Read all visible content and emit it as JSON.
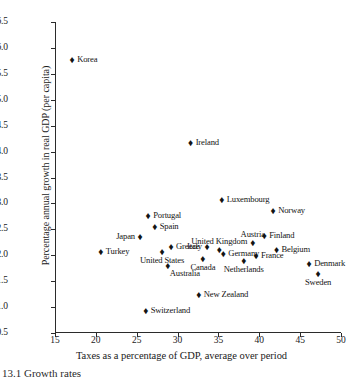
{
  "chart_data": {
    "type": "scatter",
    "title": "",
    "xlabel": "Taxes as a percentage of GDP, average over period",
    "ylabel": "Percentage annual growth in real GDP (per capita)",
    "xlim": [
      15,
      50
    ],
    "ylim": [
      0.5,
      6.5
    ],
    "xticks": [
      "15",
      "20",
      "25",
      "30",
      "35",
      "40",
      "45",
      "50"
    ],
    "yticks": [
      "0.5",
      "1.0",
      "1.5",
      "2.0",
      "2.5",
      "3.0",
      "3.5",
      "4.0",
      "4.5",
      "5.0",
      "5.5",
      "6.0",
      "6.5"
    ],
    "grid": false,
    "legend": false,
    "marker": "diamond",
    "marker_color": "#141414",
    "points": [
      {
        "label": "Korea",
        "x": 17.1,
        "y": 5.76,
        "label_pos": "right"
      },
      {
        "label": "Ireland",
        "x": 31.6,
        "y": 4.17,
        "label_pos": "right"
      },
      {
        "label": "Luxembourg",
        "x": 35.4,
        "y": 3.07,
        "label_pos": "right"
      },
      {
        "label": "Norway",
        "x": 41.7,
        "y": 2.86,
        "label_pos": "right"
      },
      {
        "label": "Portugal",
        "x": 26.4,
        "y": 2.75,
        "label_pos": "right"
      },
      {
        "label": "Spain",
        "x": 27.2,
        "y": 2.54,
        "label_pos": "right"
      },
      {
        "label": "Finland",
        "x": 40.6,
        "y": 2.38,
        "label_pos": "right"
      },
      {
        "label": "Japan",
        "x": 25.4,
        "y": 2.35,
        "label_pos": "left"
      },
      {
        "label": "Austria",
        "x": 39.2,
        "y": 2.23,
        "label_pos": "above"
      },
      {
        "label": "Greece",
        "x": 29.2,
        "y": 2.15,
        "label_pos": "right"
      },
      {
        "label": "Italy",
        "x": 33.6,
        "y": 2.15,
        "label_pos": "left"
      },
      {
        "label": "United Kingdom",
        "x": 35.1,
        "y": 2.1,
        "label_pos": "above"
      },
      {
        "label": "Belgium",
        "x": 42.1,
        "y": 2.1,
        "label_pos": "right"
      },
      {
        "label": "Turkey",
        "x": 20.6,
        "y": 2.06,
        "label_pos": "right"
      },
      {
        "label": "United States",
        "x": 28.1,
        "y": 2.06,
        "label_pos": "below"
      },
      {
        "label": "Germany",
        "x": 35.6,
        "y": 2.02,
        "label_pos": "right"
      },
      {
        "label": "France",
        "x": 39.6,
        "y": 1.98,
        "label_pos": "right"
      },
      {
        "label": "Canada",
        "x": 33.1,
        "y": 1.92,
        "label_pos": "below"
      },
      {
        "label": "Netherlands",
        "x": 38.1,
        "y": 1.88,
        "label_pos": "below"
      },
      {
        "label": "Australia",
        "x": 28.8,
        "y": 1.8,
        "label_pos": "below-right"
      },
      {
        "label": "Denmark",
        "x": 46.1,
        "y": 1.84,
        "label_pos": "right"
      },
      {
        "label": "Sweden",
        "x": 47.2,
        "y": 1.63,
        "label_pos": "below"
      },
      {
        "label": "New Zealand",
        "x": 32.6,
        "y": 1.23,
        "label_pos": "right"
      },
      {
        "label": "Switzerland",
        "x": 26.1,
        "y": 0.92,
        "label_pos": "right"
      }
    ]
  },
  "caption": {
    "text": "13.1  Growth rates"
  }
}
